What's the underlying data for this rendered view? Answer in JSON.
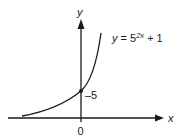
{
  "figure": {
    "equation": {
      "lhs": "y",
      "eq": " = 5",
      "exponent": "2x",
      "tail": " + 1"
    },
    "axes": {
      "x_label": "x",
      "y_label": "y",
      "origin_label": "0"
    },
    "intercept_label": "–5",
    "colors": {
      "ink": "#1a1a1a",
      "background": "#ffffff"
    }
  }
}
